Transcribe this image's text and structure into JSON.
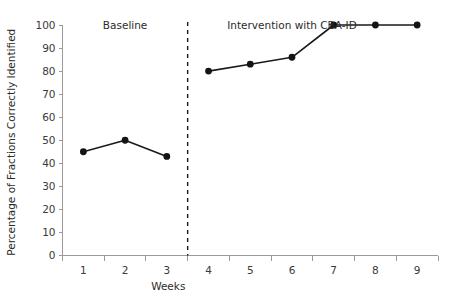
{
  "chart_data": {
    "type": "line",
    "title": "",
    "xlabel": "Weeks",
    "ylabel": "Percentage of Fractions Correctly Identified",
    "x": [
      1,
      2,
      3,
      4,
      5,
      6,
      7,
      8,
      9
    ],
    "xtick_labels": [
      "1",
      "2",
      "3",
      "4",
      "5",
      "6",
      "7",
      "8",
      "9"
    ],
    "ytick_labels": [
      "0",
      "10",
      "20",
      "30",
      "40",
      "50",
      "60",
      "70",
      "80",
      "90",
      "100"
    ],
    "ytick_values": [
      0,
      10,
      20,
      30,
      40,
      50,
      60,
      70,
      80,
      90,
      100
    ],
    "ylim": [
      0,
      100
    ],
    "xlim": [
      0.5,
      9.5
    ],
    "grid": false,
    "legend": "none",
    "series": [
      {
        "name": "Baseline",
        "x": [
          1,
          2,
          3
        ],
        "values": [
          45,
          50,
          43
        ]
      },
      {
        "name": "Intervention with CBA-ID",
        "x": [
          4,
          5,
          6,
          7,
          8,
          9
        ],
        "values": [
          80,
          83,
          86,
          100,
          100,
          100
        ]
      }
    ],
    "phase_labels": [
      {
        "text": "Baseline",
        "at_x": 2.0
      },
      {
        "text": "Intervention with CBA-ID",
        "at_x": 6.0
      }
    ],
    "phase_divider": {
      "at_x": 3.5,
      "style": "dashed"
    },
    "colors": {
      "line": "#1a1a1a",
      "marker": "#141414",
      "axis": "#9a9a9a",
      "text": "#2b2b2b",
      "background": "#ffffff",
      "divider": "#1a1a1a"
    }
  }
}
